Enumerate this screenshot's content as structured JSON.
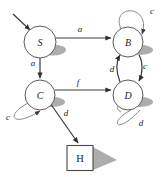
{
  "diagram": {
    "type": "state-transition-diagram",
    "title": "",
    "nodes": [
      {
        "id": "S",
        "label": "S",
        "shape": "circle",
        "x": 40,
        "y": 42,
        "r": 16
      },
      {
        "id": "B",
        "label": "B",
        "shape": "circle",
        "x": 128,
        "y": 42,
        "r": 15
      },
      {
        "id": "C",
        "label": "C",
        "shape": "circle",
        "x": 40,
        "y": 95,
        "r": 15
      },
      {
        "id": "D",
        "label": "D",
        "shape": "circle",
        "x": 128,
        "y": 95,
        "r": 15
      },
      {
        "id": "H",
        "label": "H",
        "shape": "square",
        "x": 80,
        "y": 158,
        "w": 26,
        "h": 25
      }
    ],
    "start_marker": {
      "from_x": 13,
      "from_y": 14,
      "to_x": 31,
      "to_y": 31
    },
    "edges": [
      {
        "from": "S",
        "to": "B",
        "label": "a",
        "label_x": 80,
        "label_y": 29
      },
      {
        "from": "S",
        "to": "C",
        "label": "a",
        "label_x": 33,
        "label_y": 63
      },
      {
        "from": "C",
        "to": "D",
        "label": "f",
        "label_x": 78,
        "label_y": 82
      },
      {
        "from": "D",
        "to": "B",
        "label": "d",
        "label_x": 112,
        "label_y": 69
      },
      {
        "from": "B",
        "to": "D",
        "label": "c",
        "label_x": 145,
        "label_y": 66
      },
      {
        "from": "C",
        "to": "H",
        "label": "d",
        "label_x": 66,
        "label_y": 113
      },
      {
        "from": "B",
        "to": "B",
        "label": "c",
        "label_x": 152,
        "label_y": 11,
        "self_loop": true
      },
      {
        "from": "C",
        "to": "C",
        "label": "c",
        "label_x": 8,
        "label_y": 117,
        "self_loop": true
      },
      {
        "from": "D",
        "to": "D",
        "label": "d",
        "label_x": 141,
        "label_y": 123,
        "self_loop": true
      }
    ]
  },
  "colors": {
    "background": "#ffffff",
    "node_stroke": "#5a5a5a",
    "edge_stroke": "#6b6b6b",
    "shadow": "#8d8d8d",
    "text": "#1d1d1d"
  }
}
